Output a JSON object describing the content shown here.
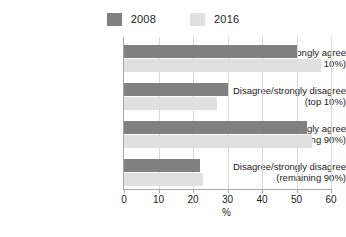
{
  "chart_data": {
    "type": "bar",
    "orientation": "horizontal",
    "title": "",
    "xlabel": "%",
    "ylabel": "",
    "xlim": [
      0,
      60
    ],
    "xticks": [
      0,
      10,
      20,
      30,
      40,
      50,
      60
    ],
    "grid": true,
    "legend_position": "top-center",
    "categories": [
      "Agree/strongly agree (top 10%)",
      "Disagree/strongly disagree (top 10%)",
      "Agree/strongly agree (remaining 90%)",
      "Disagree/strongly disagree (remaining 90%)"
    ],
    "category_lines": [
      [
        "Agree/strongly agree",
        "(top 10%)"
      ],
      [
        "Disagree/strongly disagree",
        "(top 10%)"
      ],
      [
        "Agree/strongly agree",
        "(remaining 90%)"
      ],
      [
        "Disagree/strongly disagree",
        "(remaining 90%)"
      ]
    ],
    "series": [
      {
        "name": "2008",
        "color": "#808080",
        "values": [
          50,
          30,
          53,
          22
        ]
      },
      {
        "name": "2016",
        "color": "#e0e0e0",
        "values": [
          57,
          27,
          54.5,
          23
        ]
      }
    ]
  },
  "legend": {
    "entries": [
      {
        "label": "2008",
        "color": "#808080"
      },
      {
        "label": "2016",
        "color": "#e0e0e0"
      }
    ]
  },
  "axis": {
    "x_title": "%",
    "tick_labels": [
      "0",
      "10",
      "20",
      "30",
      "40",
      "50",
      "60"
    ]
  },
  "colors": {
    "series_2008": "#808080",
    "series_2016": "#e0e0e0",
    "axis_line": "#a8a8a8",
    "gridline": "#d6d6d6",
    "text": "#1b1b1b",
    "background": "#ffffff"
  }
}
